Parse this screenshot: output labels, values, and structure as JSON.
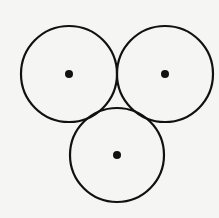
{
  "diagram": {
    "background": "#f5f5f3",
    "stroke_color": "#111111",
    "stroke_width": 2.2,
    "dot_radius": 4,
    "circles": [
      {
        "id": "top-left",
        "cx": 69,
        "cy": 74,
        "r": 48
      },
      {
        "id": "top-right",
        "cx": 165,
        "cy": 74,
        "r": 48
      },
      {
        "id": "bottom",
        "cx": 117,
        "cy": 155,
        "r": 47
      }
    ]
  }
}
